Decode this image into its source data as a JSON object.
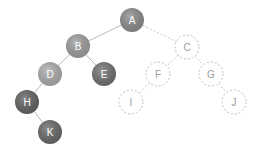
{
  "diagram": {
    "type": "binary-tree",
    "nodes": [
      {
        "id": "A",
        "label": "A",
        "x": 132,
        "y": 20,
        "style": "filled",
        "color": "#8c8c8c"
      },
      {
        "id": "B",
        "label": "B",
        "x": 78,
        "y": 46,
        "style": "filled",
        "color": "#9e9e9e"
      },
      {
        "id": "C",
        "label": "C",
        "x": 187,
        "y": 47,
        "style": "dashed"
      },
      {
        "id": "D",
        "label": "D",
        "x": 50,
        "y": 74,
        "style": "filled",
        "color": "#acacac"
      },
      {
        "id": "E",
        "label": "E",
        "x": 104,
        "y": 74,
        "style": "filled",
        "color": "#727272"
      },
      {
        "id": "F",
        "label": "F",
        "x": 158,
        "y": 74,
        "style": "dashed"
      },
      {
        "id": "G",
        "label": "G",
        "x": 211,
        "y": 74,
        "style": "dashed"
      },
      {
        "id": "H",
        "label": "H",
        "x": 27,
        "y": 102,
        "style": "filled",
        "color": "#636363"
      },
      {
        "id": "I",
        "label": "I",
        "x": 131,
        "y": 102,
        "style": "dashed"
      },
      {
        "id": "J",
        "label": "J",
        "x": 234,
        "y": 102,
        "style": "dashed"
      },
      {
        "id": "K",
        "label": "K",
        "x": 50,
        "y": 132,
        "style": "filled",
        "color": "#6a6a6a"
      }
    ],
    "edges": [
      {
        "from": "A",
        "to": "B",
        "style": "solid"
      },
      {
        "from": "A",
        "to": "C",
        "style": "dashed"
      },
      {
        "from": "B",
        "to": "D",
        "style": "solid"
      },
      {
        "from": "B",
        "to": "E",
        "style": "solid"
      },
      {
        "from": "C",
        "to": "F",
        "style": "dashed"
      },
      {
        "from": "C",
        "to": "G",
        "style": "dashed"
      },
      {
        "from": "D",
        "to": "H",
        "style": "solid"
      },
      {
        "from": "F",
        "to": "I",
        "style": "dashed"
      },
      {
        "from": "G",
        "to": "J",
        "style": "dashed"
      },
      {
        "from": "H",
        "to": "K",
        "style": "solid"
      }
    ],
    "node_radius": 12
  }
}
